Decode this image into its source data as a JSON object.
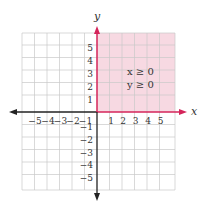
{
  "graph": {
    "x_axis_label": "x",
    "y_axis_label": "y",
    "x_ticks_negative": [
      "−5",
      "−4",
      "−3",
      "−2",
      "−1"
    ],
    "x_ticks_positive": [
      "1",
      "2",
      "3",
      "4",
      "5"
    ],
    "y_ticks_positive": [
      "5",
      "4",
      "3",
      "2",
      "1"
    ],
    "y_ticks_negative": [
      "−1",
      "−2",
      "−3",
      "−4",
      "−5"
    ],
    "inequalities": [
      "x ≥ 0",
      "y ≥ 0"
    ],
    "range": {
      "x": [
        -6,
        6
      ],
      "y": [
        -6,
        6
      ]
    },
    "colors": {
      "shaded_region": "#f7d9e2",
      "grid_line": "#c8c8c8",
      "axis_black": "#222222",
      "axis_highlight": "#d4245a"
    }
  }
}
